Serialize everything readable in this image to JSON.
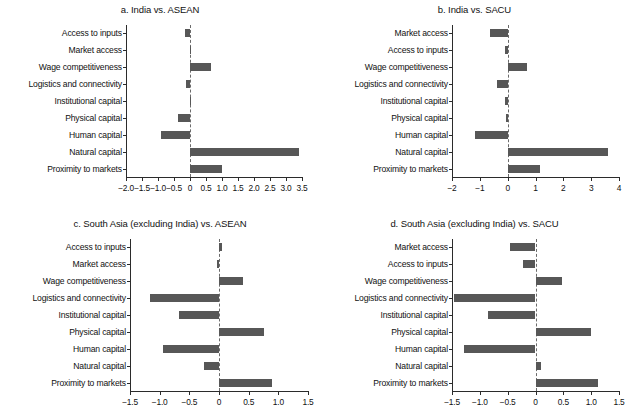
{
  "figure": {
    "bar_color": "#575757",
    "axis_color": "#2b2b2b",
    "background": "#ffffff"
  },
  "chart_data": [
    {
      "id": "a",
      "type": "bar",
      "orientation": "horizontal",
      "title": "a. India vs. ASEAN",
      "xlabel": "",
      "ylabel": "",
      "grid": false,
      "legend": null,
      "xlim": [
        -2.0,
        3.5
      ],
      "xticks": [
        -2.0,
        -1.5,
        -1.0,
        -0.5,
        0,
        0.5,
        1.0,
        1.5,
        2.0,
        2.5,
        3.0,
        3.5
      ],
      "xticklabels": [
        "-2.0",
        "-1.5",
        "-1.0",
        "-0.5",
        "0",
        "0.5",
        "1.0",
        "1.5",
        "2.0",
        "2.5",
        "3.0",
        "3.5"
      ],
      "categories": [
        "Access to inputs",
        "Market access",
        "Wage competitiveness",
        "Logistics and connectivity",
        "Institutional capital",
        "Physical capital",
        "Human capital",
        "Natural capital",
        "Proximity to markets"
      ],
      "values": [
        -0.15,
        0.02,
        0.67,
        -0.13,
        0.0,
        -0.38,
        -0.9,
        3.4,
        1.0
      ]
    },
    {
      "id": "b",
      "type": "bar",
      "orientation": "horizontal",
      "title": "b. India vs. SACU",
      "xlabel": "",
      "ylabel": "",
      "grid": false,
      "legend": null,
      "xlim": [
        -2,
        4
      ],
      "xticks": [
        -2,
        -1,
        0,
        1,
        2,
        3,
        4
      ],
      "xticklabels": [
        "-2",
        "-1",
        "0",
        "1",
        "2",
        "3",
        "4"
      ],
      "categories": [
        "Market access",
        "Access to inputs",
        "Wage competitiveness",
        "Logistics and connectivity",
        "Institutional capital",
        "Physical capital",
        "Human capital",
        "Natural capital",
        "Proximity to markets"
      ],
      "values": [
        -0.62,
        -0.08,
        0.68,
        -0.4,
        -0.08,
        -0.07,
        -1.18,
        3.6,
        1.18
      ]
    },
    {
      "id": "c",
      "type": "bar",
      "orientation": "horizontal",
      "title": "c. South Asia (excluding India) vs. ASEAN",
      "xlabel": "",
      "ylabel": "",
      "grid": false,
      "legend": null,
      "xlim": [
        -1.5,
        1.5
      ],
      "xticks": [
        -1.5,
        -1.0,
        -0.5,
        0,
        0.5,
        1.0,
        1.5
      ],
      "xticklabels": [
        "-1.5",
        "-1.0",
        "-0.5",
        "0",
        "0.5",
        "1.0",
        "1.5"
      ],
      "categories": [
        "Access to inputs",
        "Market access",
        "Wage competitiveness",
        "Logistics and connectivity",
        "Institutional capital",
        "Physical capital",
        "Human capital",
        "Natural capital",
        "Proximity to markets"
      ],
      "values": [
        0.05,
        -0.03,
        0.4,
        -1.16,
        -0.67,
        0.75,
        -0.95,
        -0.26,
        0.9
      ]
    },
    {
      "id": "d",
      "type": "bar",
      "orientation": "horizontal",
      "title": "d. South Asia (excluding India) vs. SACU",
      "xlabel": "",
      "ylabel": "",
      "grid": false,
      "legend": null,
      "xlim": [
        -1.5,
        1.5
      ],
      "xticks": [
        -1.5,
        -1.0,
        -0.5,
        0,
        0.5,
        1.0,
        1.5
      ],
      "xticklabels": [
        "-1.5",
        "-1.0",
        "-0.5",
        "0",
        "0.5",
        "1.0",
        "1.5"
      ],
      "categories": [
        "Market access",
        "Access to inputs",
        "Wage competitiveness",
        "Logistics and connectivity",
        "Institutional capital",
        "Physical capital",
        "Human capital",
        "Natural capital",
        "Proximity to markets"
      ],
      "values": [
        -0.45,
        -0.22,
        0.47,
        -1.47,
        -0.85,
        1.0,
        -1.28,
        0.09,
        1.13
      ]
    }
  ]
}
